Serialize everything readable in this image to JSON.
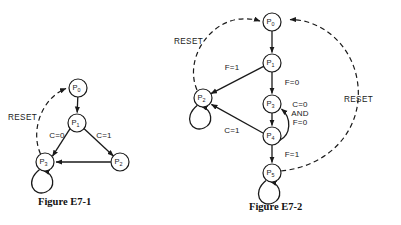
{
  "figures": [
    {
      "id": "E7-1",
      "caption": "Figure E7-1",
      "reset_label": "RESET",
      "nodes": [
        {
          "name": "P0",
          "label": "P",
          "sub": "0",
          "cx": 78,
          "cy": 88,
          "r": 9
        },
        {
          "name": "P1",
          "label": "P",
          "sub": "1",
          "cx": 77,
          "cy": 123,
          "r": 9
        },
        {
          "name": "P2",
          "label": "P",
          "sub": "2",
          "cx": 120,
          "cy": 162,
          "r": 9
        },
        {
          "name": "P3",
          "label": "P",
          "sub": "3",
          "cx": 45,
          "cy": 162,
          "r": 9
        }
      ],
      "edges": [
        {
          "from": "P0",
          "to": "P1",
          "label": ""
        },
        {
          "from": "P1",
          "to": "P3",
          "label": "C=0"
        },
        {
          "from": "P1",
          "to": "P2",
          "label": "C=1"
        },
        {
          "from": "P2",
          "to": "P3",
          "label": ""
        },
        {
          "from": "P3",
          "to": "P3",
          "label": "",
          "type": "self-loop"
        },
        {
          "from": "P3",
          "to": "P0",
          "label": "RESET",
          "type": "dashed"
        }
      ],
      "edge_labels": [
        {
          "text": "C=0",
          "x": 57,
          "y": 136
        },
        {
          "text": "C=1",
          "x": 104,
          "y": 136
        }
      ]
    },
    {
      "id": "E7-2",
      "caption": "Figure E7-2",
      "reset_label": "RESET",
      "nodes": [
        {
          "name": "P0",
          "label": "P",
          "sub": "0",
          "cx": 272,
          "cy": 22,
          "r": 9
        },
        {
          "name": "P1",
          "label": "P",
          "sub": "1",
          "cx": 272,
          "cy": 63,
          "r": 9
        },
        {
          "name": "P2",
          "label": "P",
          "sub": "2",
          "cx": 203,
          "cy": 98,
          "r": 9
        },
        {
          "name": "P3",
          "label": "P",
          "sub": "3",
          "cx": 272,
          "cy": 104,
          "r": 9
        },
        {
          "name": "P4",
          "label": "P",
          "sub": "4",
          "cx": 272,
          "cy": 136,
          "r": 9
        },
        {
          "name": "P5",
          "label": "P",
          "sub": "5",
          "cx": 272,
          "cy": 173,
          "r": 9
        }
      ],
      "edges": [
        {
          "from": "P0",
          "to": "P1",
          "label": ""
        },
        {
          "from": "P1",
          "to": "P2",
          "label": "F=1"
        },
        {
          "from": "P1",
          "to": "P3",
          "label": "F=0"
        },
        {
          "from": "P3",
          "to": "P4",
          "label": ""
        },
        {
          "from": "P4",
          "to": "P3",
          "label": "C=0 AND F=0",
          "type": "curved"
        },
        {
          "from": "P4",
          "to": "P2",
          "label": "C=1"
        },
        {
          "from": "P4",
          "to": "P5",
          "label": "F=1"
        },
        {
          "from": "P2",
          "to": "P2",
          "label": "",
          "type": "self-loop"
        },
        {
          "from": "P5",
          "to": "P5",
          "label": "",
          "type": "self-loop"
        },
        {
          "from": "P2",
          "to": "P0",
          "label": "RESET",
          "type": "dashed"
        },
        {
          "from": "P5",
          "to": "P0",
          "label": "RESET",
          "type": "dashed"
        }
      ],
      "edge_labels": [
        {
          "text": "F=1",
          "x": 232,
          "y": 68
        },
        {
          "text": "F=0",
          "x": 292,
          "y": 83
        },
        {
          "text": "C=0",
          "x": 300,
          "y": 105
        },
        {
          "text": "AND",
          "x": 300,
          "y": 114
        },
        {
          "text": "F=0",
          "x": 300,
          "y": 123
        },
        {
          "text": "C=1",
          "x": 232,
          "y": 131
        },
        {
          "text": "F=1",
          "x": 292,
          "y": 155
        }
      ],
      "reset_labels": [
        {
          "text": "RESET",
          "x": 177,
          "y": 42
        },
        {
          "text": "RESET",
          "x": 352,
          "y": 100
        }
      ]
    }
  ]
}
